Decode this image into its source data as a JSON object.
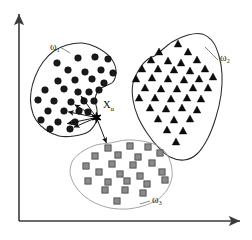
{
  "figure": {
    "name": "knn-cluster-diagram",
    "background": "#ffffff",
    "width": 252,
    "height": 240
  },
  "axes": {
    "x_axis_label": "",
    "y_axis_label": "",
    "origin": [
      19,
      221
    ],
    "x_end": [
      240,
      221
    ],
    "y_end": [
      19,
      14
    ],
    "color": "#3a3a3a"
  },
  "labels": {
    "omega1": "ω₁",
    "omega2": "ω₂",
    "omega3": "ω₃",
    "xu": "X",
    "xu_sub": "u"
  },
  "chart_data": {
    "type": "scatter",
    "title": "",
    "xlabel": "",
    "ylabel": "",
    "xlim": [
      0,
      252
    ],
    "ylim": [
      240,
      0
    ],
    "grid": false,
    "legend": "inline-annotations",
    "query_point": {
      "name": "X_u",
      "marker": "star",
      "color": "#000000",
      "x": 96.5,
      "y": 117.5,
      "label_x": 103,
      "label_y": 108
    },
    "neighbor_arrows": [
      {
        "from": [
          96.5,
          117.5
        ],
        "to": [
          78.5,
          92.5
        ],
        "target_class": "ω₁"
      },
      {
        "from": [
          96.5,
          117.5
        ],
        "to": [
          71.0,
          102.5
        ],
        "target_class": "ω₁"
      },
      {
        "from": [
          96.5,
          117.5
        ],
        "to": [
          64.0,
          111.0
        ],
        "target_class": "ω₁"
      },
      {
        "from": [
          96.5,
          117.5
        ],
        "to": [
          63.0,
          124.5
        ],
        "target_class": "ω₁"
      },
      {
        "from": [
          96.5,
          117.5
        ],
        "to": [
          70.0,
          129.0
        ],
        "target_class": "ω₁"
      },
      {
        "from": [
          96.5,
          117.5
        ],
        "to": [
          108.0,
          147.0
        ],
        "target_class": "ω₃"
      }
    ],
    "series": [
      {
        "name": "ω₁",
        "marker": "circle",
        "color": "#1a1a1a",
        "edge_color": "#000000",
        "label_pos": [
          50,
          50
        ],
        "hull": [
          [
            67,
            45
          ],
          [
            82,
            43
          ],
          [
            96,
            47
          ],
          [
            110,
            57
          ],
          [
            116,
            70
          ],
          [
            113,
            82
          ],
          [
            100,
            89
          ],
          [
            95,
            99
          ],
          [
            97,
            110
          ],
          [
            96,
            122
          ],
          [
            88,
            132
          ],
          [
            74,
            136
          ],
          [
            59,
            136
          ],
          [
            46,
            130
          ],
          [
            36,
            120
          ],
          [
            31,
            106
          ],
          [
            31,
            92
          ],
          [
            35,
            77
          ],
          [
            43,
            62
          ],
          [
            54,
            51
          ]
        ],
        "points": [
          [
            57,
            63
          ],
          [
            78,
            58
          ],
          [
            95,
            57
          ],
          [
            108,
            59
          ],
          [
            68,
            70
          ],
          [
            85,
            72
          ],
          [
            101,
            70
          ],
          [
            113,
            73
          ],
          [
            58,
            81
          ],
          [
            75,
            80
          ],
          [
            92,
            79
          ],
          [
            104,
            83
          ],
          [
            45,
            90
          ],
          [
            64,
            89
          ],
          [
            78,
            92
          ],
          [
            89,
            92
          ],
          [
            99,
            90
          ],
          [
            38,
            100
          ],
          [
            54,
            101
          ],
          [
            71,
            102
          ],
          [
            84,
            101
          ],
          [
            94,
            101
          ],
          [
            48,
            111
          ],
          [
            64,
            111
          ],
          [
            79,
            111
          ],
          [
            88,
            112
          ],
          [
            41,
            120
          ],
          [
            58,
            122
          ],
          [
            75,
            122
          ],
          [
            50,
            129
          ],
          [
            70,
            129
          ]
        ]
      },
      {
        "name": "ω₂",
        "marker": "triangle",
        "color": "#0d0d0d",
        "edge_color": "#000000",
        "label_pos": [
          220,
          61
        ],
        "hull": [
          [
            156,
            55
          ],
          [
            172,
            42
          ],
          [
            188,
            35
          ],
          [
            202,
            34
          ],
          [
            213,
            42
          ],
          [
            219,
            56
          ],
          [
            222,
            74
          ],
          [
            221,
            95
          ],
          [
            216,
            117
          ],
          [
            208,
            138
          ],
          [
            197,
            154
          ],
          [
            184,
            160
          ],
          [
            170,
            157
          ],
          [
            158,
            147
          ],
          [
            147,
            133
          ],
          [
            138,
            117
          ],
          [
            133,
            100
          ],
          [
            133,
            83
          ],
          [
            140,
            68
          ],
          [
            148,
            59
          ]
        ],
        "points": [
          [
            178,
            44
          ],
          [
            159,
            52
          ],
          [
            188,
            52
          ],
          [
            151,
            60
          ],
          [
            168,
            61
          ],
          [
            181,
            63
          ],
          [
            197,
            60
          ],
          [
            142,
            69
          ],
          [
            158,
            69
          ],
          [
            174,
            70
          ],
          [
            190,
            71
          ],
          [
            205,
            69
          ],
          [
            136,
            79
          ],
          [
            152,
            78
          ],
          [
            168,
            79
          ],
          [
            184,
            80
          ],
          [
            199,
            79
          ],
          [
            213,
            77
          ],
          [
            145,
            88
          ],
          [
            161,
            89
          ],
          [
            177,
            89
          ],
          [
            193,
            88
          ],
          [
            208,
            88
          ],
          [
            139,
            98
          ],
          [
            155,
            98
          ],
          [
            171,
            99
          ],
          [
            187,
            98
          ],
          [
            201,
            99
          ],
          [
            150,
            108
          ],
          [
            166,
            109
          ],
          [
            182,
            108
          ],
          [
            197,
            110
          ],
          [
            158,
            119
          ],
          [
            174,
            120
          ],
          [
            190,
            119
          ],
          [
            167,
            130
          ],
          [
            183,
            131
          ],
          [
            176,
            142
          ]
        ]
      },
      {
        "name": "ω₃",
        "marker": "square",
        "color": "#8a8a8a",
        "edge_color": "#4d4d4d",
        "label_pos": [
          152,
          203
        ],
        "hull": [
          [
            110,
            143
          ],
          [
            126,
            140
          ],
          [
            142,
            141
          ],
          [
            156,
            145
          ],
          [
            166,
            153
          ],
          [
            171,
            164
          ],
          [
            172,
            177
          ],
          [
            167,
            190
          ],
          [
            157,
            200
          ],
          [
            143,
            206
          ],
          [
            127,
            209
          ],
          [
            110,
            208
          ],
          [
            95,
            203
          ],
          [
            83,
            195
          ],
          [
            74,
            184
          ],
          [
            70,
            172
          ],
          [
            73,
            160
          ],
          [
            83,
            151
          ],
          [
            96,
            145
          ]
        ],
        "points": [
          [
            108,
            148
          ],
          [
            130,
            146
          ],
          [
            148,
            147
          ],
          [
            95,
            156
          ],
          [
            118,
            155
          ],
          [
            138,
            157
          ],
          [
            160,
            153
          ],
          [
            86,
            166
          ],
          [
            112,
            164
          ],
          [
            133,
            165
          ],
          [
            152,
            163
          ],
          [
            99,
            172
          ],
          [
            120,
            174
          ],
          [
            140,
            176
          ],
          [
            162,
            172
          ],
          [
            88,
            181
          ],
          [
            108,
            182
          ],
          [
            127,
            181
          ],
          [
            147,
            184
          ],
          [
            165,
            180
          ],
          [
            105,
            190
          ],
          [
            125,
            190
          ],
          [
            143,
            193
          ],
          [
            117,
            201
          ]
        ]
      }
    ]
  }
}
